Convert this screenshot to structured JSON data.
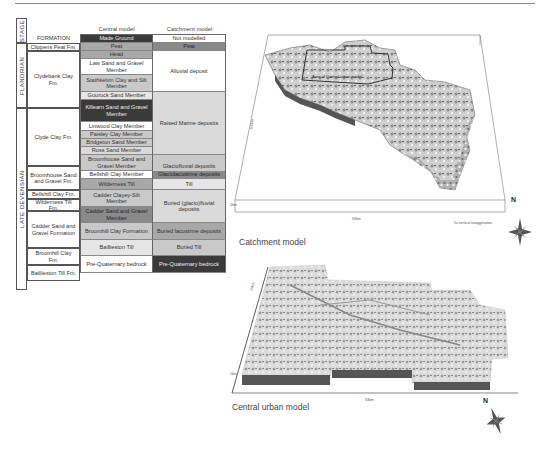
{
  "table": {
    "stage_header": "STAGE",
    "formation_header": "FORMATION",
    "col_central": "Central model",
    "col_catchment": "Catchment model",
    "stages": [
      "FLANDRIAN",
      "LATE DEVENSIAN"
    ],
    "formations": [
      "Clippens Peat Fm.",
      "Clydebank Clay Fm.",
      "Clyde Clay Fm.",
      "Broomhouse Sand and Gravel Fm.",
      "Bellshill Clay Fm.",
      "Wilderness Till Fm.",
      "Cadder Sand and Gravel Formation",
      "Broomhill Clay Fm.",
      "Baillieston Till Fm."
    ],
    "central": [
      "Made Ground",
      "Peat",
      "Head",
      "Law Sand and Gravel Member",
      "Stathkelvin Clay and Silt Member",
      "Gourock Sand Member",
      "Killearn Sand and Gravel Member",
      "Linwood Clay Member",
      "Paisley Clay Member",
      "Bridgeton Sand Member",
      "Ross Sand Member",
      "Broomhouse Sand and Gravel Member",
      "Bellshill Clay Member",
      "Wilderness Till",
      "Cadder Clayey-Silt Member",
      "Cadder Sand and Gravel Member",
      "Broomhill Clay Formation",
      "Baillieston Till",
      "Pre-Quaternary bedrock"
    ],
    "catchment": [
      "Not modelled",
      "Peat",
      "Alluvial deposit",
      "Raised Marine deposits",
      "Glaciofluvial deposits",
      "Glaciolacustrine deposits",
      "Till",
      "Buried (glacio)fluvial deposits",
      "Buried lacustrine deposits",
      "Buried Till",
      "Pre-Quaternary bedrock"
    ]
  },
  "catchment_model": {
    "caption": "Catchment model",
    "inset_label": "Area of Central urban model",
    "depth_label": "110km",
    "width_label": "90km",
    "height_label": "1km",
    "exaggeration": "5x vertical exaggeration",
    "north": "N"
  },
  "urban_model": {
    "caption": "Central urban model",
    "depth_label": "20km",
    "width_label": "33km",
    "height_label": "1km",
    "north": "N"
  }
}
